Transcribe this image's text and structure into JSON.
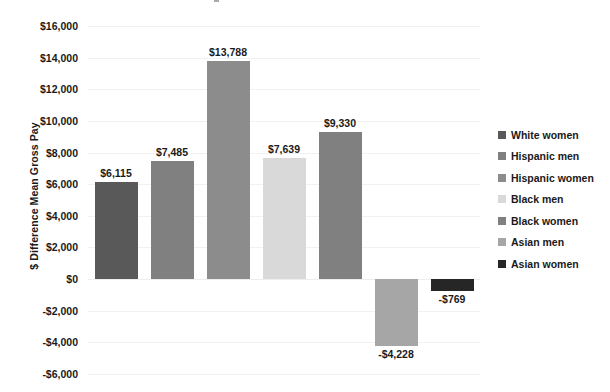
{
  "chart_data": {
    "type": "bar",
    "title": "",
    "subtitle": "",
    "xlabel": "",
    "ylabel": "$ Difference Mean Gross Pay",
    "categories": [
      "White women",
      "Hispanic men",
      "Hispanic women",
      "Black men",
      "Black women",
      "Asian men",
      "Asian women"
    ],
    "values": [
      6115,
      7485,
      13788,
      7639,
      9330,
      -4228,
      -769
    ],
    "value_labels": [
      "$6,115",
      "$7,485",
      "$13,788",
      "$7,639",
      "$9,330",
      "-$4,228",
      "-$769"
    ],
    "colors": [
      "#595959",
      "#808080",
      "#8c8c8c",
      "#d9d9d9",
      "#808080",
      "#a6a6a6",
      "#262626"
    ],
    "ylim": [
      -6000,
      16000
    ],
    "ytick_values": [
      16000,
      14000,
      12000,
      10000,
      8000,
      6000,
      4000,
      2000,
      0,
      -2000,
      -4000,
      -6000
    ],
    "ytick_labels": [
      "$16,000",
      "$14,000",
      "$12,000",
      "$10,000",
      "$8,000",
      "$6,000",
      "$4,000",
      "$2,000",
      "$0",
      "-$2,000",
      "-$4,000",
      "-$6,000"
    ],
    "grid": true,
    "grid_axis": "y",
    "legend_position": "right",
    "legend": [
      {
        "label": "White women",
        "color": "#595959"
      },
      {
        "label": "Hispanic men",
        "color": "#808080"
      },
      {
        "label": "Hispanic women",
        "color": "#8c8c8c"
      },
      {
        "label": "Black men",
        "color": "#d9d9d9"
      },
      {
        "label": "Black women",
        "color": "#808080"
      },
      {
        "label": "Asian men",
        "color": "#a6a6a6"
      },
      {
        "label": "Asian women",
        "color": "#262626"
      }
    ]
  }
}
